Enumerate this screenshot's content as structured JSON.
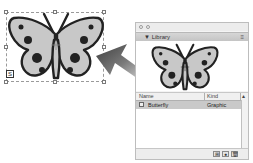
{
  "canvas": {
    "selection": {
      "symbol_badge_icon": "symbol-instance-icon",
      "badge_glyph": "S"
    },
    "arrow": {
      "direction": "right-to-left",
      "color": "#4a4a4a"
    }
  },
  "library_panel": {
    "title": "Library",
    "collapse_glyph": "▼",
    "menu_glyph": "≡",
    "table": {
      "columns": [
        {
          "label": "Name"
        },
        {
          "label": "Kind"
        },
        {
          "label": "▴"
        }
      ],
      "rows": [
        {
          "name": "Butterfly",
          "kind": "Graphic",
          "selected": true
        }
      ]
    },
    "bottom_buttons": [
      {
        "icon": "new-symbol-icon",
        "glyph": "⊞"
      },
      {
        "icon": "properties-icon",
        "glyph": "●"
      },
      {
        "icon": "trash-icon",
        "glyph": "🗑"
      }
    ]
  },
  "colors": {
    "butterfly_fill": "#c8c8c8",
    "butterfly_stroke": "#222222",
    "selected_row": "#c9c9c9"
  }
}
